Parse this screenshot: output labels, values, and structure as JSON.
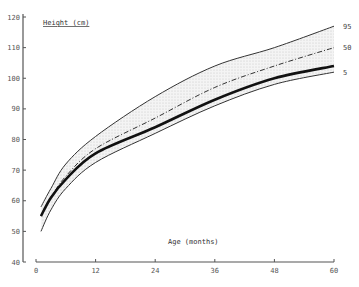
{
  "chart_data": {
    "type": "line",
    "title": "",
    "ylabel": "Height (cm)",
    "xlabel": "Age (months)",
    "xlim": [
      0,
      60
    ],
    "ylim": [
      40,
      120
    ],
    "x_ticks": [
      0,
      12,
      24,
      36,
      48,
      60
    ],
    "x_tick_labels": [
      "0",
      "12",
      "24",
      "36",
      "48",
      "60"
    ],
    "y_ticks": [
      40,
      50,
      60,
      70,
      80,
      90,
      100,
      110,
      120
    ],
    "y_tick_labels": [
      "40",
      "50",
      "60",
      "70",
      "80",
      "90",
      "100",
      "110",
      "120"
    ],
    "grid": false,
    "legend": "inline labels at right end of percentile curves",
    "band": {
      "between": [
        "95",
        "5"
      ],
      "fill": "stippled light gray"
    },
    "x": [
      1,
      3,
      6,
      12,
      24,
      36,
      48,
      60
    ],
    "series": [
      {
        "name": "95",
        "style": "thin solid",
        "values": [
          58,
          64,
          72,
          81,
          94,
          104,
          110,
          117
        ]
      },
      {
        "name": "50",
        "style": "dash-dot",
        "values": [
          55,
          61,
          68,
          77,
          87,
          97,
          104,
          110
        ]
      },
      {
        "name": "child",
        "style": "thick solid",
        "values": [
          55,
          61,
          67,
          75.5,
          84,
          93,
          100,
          104
        ]
      },
      {
        "name": "5",
        "style": "thin solid",
        "values": [
          50,
          57,
          64,
          72.5,
          82,
          91,
          98,
          102
        ]
      }
    ],
    "series_labels": [
      "95",
      "50",
      "5"
    ]
  },
  "axes": {
    "ylabel": "Height (cm)",
    "xlabel": "Age (months)"
  }
}
